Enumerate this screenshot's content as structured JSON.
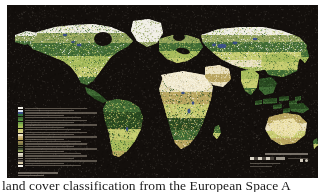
{
  "figure": {
    "kind": "world-land-cover-map",
    "projection_note": "equirectangular world map",
    "background_color": "#130f0c",
    "page_color": "#ffffff"
  },
  "map": {
    "title_present": false,
    "ocean_color": "#130f0c",
    "ice_color": "#f2f0e8",
    "desert_color": "#ece3c4",
    "grass_color": "#c9cf72",
    "forest_color": "#3f6b34",
    "dark_forest_color": "#27471f",
    "water_color": "#3a4f86",
    "tundra_color": "#8fa05a",
    "crop_color": "#a8bd5c",
    "shrub_color": "#b9a55f"
  },
  "legend": {
    "title": "Land cover classes",
    "position": "lower-left",
    "swatch_colors": [
      "#f2f0e8",
      "#d9e4ee",
      "#3a4f86",
      "#2f6f3a",
      "#3f6b34",
      "#4f8a3b",
      "#6fa04a",
      "#8fb34f",
      "#a8bd5c",
      "#c9cf72",
      "#d9d08a",
      "#ece3c4",
      "#cdb77e",
      "#b9a55f",
      "#9a8a52",
      "#7f7a4a",
      "#5e6b3f",
      "#47553a",
      "#8fa05a",
      "#e3ddcb",
      "#bfb9a6",
      "#8c857a",
      "#5a554d",
      "#d7c9a4",
      "#f6f3ea"
    ],
    "footer_lines": 2
  },
  "scale": {
    "title": "Scale",
    "bar_segments": 6,
    "label": "0",
    "units_line": "kilometres",
    "credit_line": "projection"
  },
  "caption": {
    "text": "land cover classification from the European Space A",
    "clipped": true
  }
}
